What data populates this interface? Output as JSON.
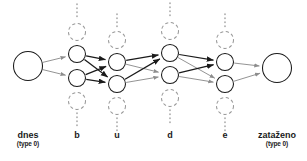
{
  "diagram": {
    "colors": {
      "node_stroke": "#1a1a1a",
      "ghost_stroke": "#9a9a9a",
      "edge_strong": "#1a1a1a",
      "edge_weak": "#8d8d8d",
      "background": "#ffffff",
      "label": "#1a1a1a"
    },
    "geometry": {
      "width": 307,
      "height": 161,
      "node_radius": 8.5,
      "terminal_radius": 14.5,
      "ghost_radius": 8.5
    },
    "columns": [
      {
        "id": "start",
        "label": "dnes",
        "sublabel": "(type 0)",
        "label_x": 28,
        "label_y": 130,
        "kind": "terminal",
        "nodes": [
          {
            "x": 28,
            "y": 66,
            "r": 14.5
          }
        ],
        "ghosts": []
      },
      {
        "id": "b",
        "label": "b",
        "sublabel": "",
        "label_x": 77,
        "label_y": 130,
        "kind": "stack",
        "nodes": [
          {
            "x": 77,
            "y": 54,
            "r": 8.5
          },
          {
            "x": 77,
            "y": 78,
            "r": 8.5
          }
        ],
        "ghosts": [
          {
            "x": 77,
            "y": 32,
            "r": 8.5,
            "dots_from": 4,
            "dots_to": 20,
            "side": "top"
          },
          {
            "x": 77,
            "y": 101,
            "r": 8.5,
            "dots_from": 113,
            "dots_to": 128,
            "side": "bottom"
          }
        ]
      },
      {
        "id": "u",
        "label": "u",
        "sublabel": "",
        "label_x": 117,
        "label_y": 130,
        "kind": "stack",
        "nodes": [
          {
            "x": 117,
            "y": 62,
            "r": 8.5
          },
          {
            "x": 117,
            "y": 84,
            "r": 8.5
          }
        ],
        "ghosts": [
          {
            "x": 117,
            "y": 40,
            "r": 8.5,
            "dots_from": 14,
            "dots_to": 29,
            "side": "top"
          },
          {
            "x": 117,
            "y": 106,
            "r": 8.5,
            "dots_from": 118,
            "dots_to": 133,
            "side": "bottom"
          }
        ]
      },
      {
        "id": "d",
        "label": "d",
        "sublabel": "",
        "label_x": 170,
        "label_y": 130,
        "kind": "stack",
        "nodes": [
          {
            "x": 170,
            "y": 53,
            "r": 8.5
          },
          {
            "x": 170,
            "y": 75,
            "r": 8.5
          }
        ],
        "ghosts": [
          {
            "x": 170,
            "y": 31,
            "r": 8.5,
            "dots_from": 3,
            "dots_to": 19,
            "side": "top"
          },
          {
            "x": 170,
            "y": 98,
            "r": 8.5,
            "dots_from": 110,
            "dots_to": 126,
            "side": "bottom"
          }
        ]
      },
      {
        "id": "e",
        "label": "e",
        "sublabel": "",
        "label_x": 225,
        "label_y": 130,
        "kind": "stack",
        "nodes": [
          {
            "x": 225,
            "y": 62,
            "r": 8.5
          },
          {
            "x": 225,
            "y": 84,
            "r": 8.5
          }
        ],
        "ghosts": [
          {
            "x": 225,
            "y": 40,
            "r": 8.5,
            "dots_from": 14,
            "dots_to": 29,
            "side": "top"
          },
          {
            "x": 225,
            "y": 106,
            "r": 8.5,
            "dots_from": 118,
            "dots_to": 133,
            "side": "bottom"
          }
        ]
      },
      {
        "id": "end",
        "label": "zataženo",
        "sublabel": "(type 0)",
        "label_x": 277,
        "label_y": 130,
        "kind": "terminal",
        "nodes": [
          {
            "x": 277,
            "y": 68,
            "r": 14.5
          }
        ],
        "ghosts": []
      }
    ],
    "edges": [
      {
        "from": [
          28,
          66
        ],
        "to": [
          77,
          54
        ],
        "weight": "weak"
      },
      {
        "from": [
          28,
          66
        ],
        "to": [
          77,
          78
        ],
        "weight": "weak"
      },
      {
        "from": [
          77,
          54
        ],
        "to": [
          117,
          62
        ],
        "weight": "strong"
      },
      {
        "from": [
          77,
          54
        ],
        "to": [
          117,
          84
        ],
        "weight": "strong"
      },
      {
        "from": [
          77,
          78
        ],
        "to": [
          117,
          62
        ],
        "weight": "strong"
      },
      {
        "from": [
          77,
          78
        ],
        "to": [
          117,
          84
        ],
        "weight": "strong"
      },
      {
        "from": [
          117,
          62
        ],
        "to": [
          170,
          53
        ],
        "weight": "strong"
      },
      {
        "from": [
          117,
          62
        ],
        "to": [
          170,
          75
        ],
        "weight": "weak"
      },
      {
        "from": [
          117,
          84
        ],
        "to": [
          170,
          53
        ],
        "weight": "strong"
      },
      {
        "from": [
          117,
          84
        ],
        "to": [
          170,
          75
        ],
        "weight": "weak"
      },
      {
        "from": [
          170,
          53
        ],
        "to": [
          225,
          62
        ],
        "weight": "strong"
      },
      {
        "from": [
          170,
          53
        ],
        "to": [
          225,
          84
        ],
        "weight": "weak"
      },
      {
        "from": [
          170,
          75
        ],
        "to": [
          225,
          62
        ],
        "weight": "strong"
      },
      {
        "from": [
          170,
          75
        ],
        "to": [
          225,
          84
        ],
        "weight": "weak"
      },
      {
        "from": [
          225,
          62
        ],
        "to": [
          277,
          68
        ],
        "weight": "weak"
      },
      {
        "from": [
          225,
          84
        ],
        "to": [
          277,
          68
        ],
        "weight": "weak"
      }
    ]
  }
}
